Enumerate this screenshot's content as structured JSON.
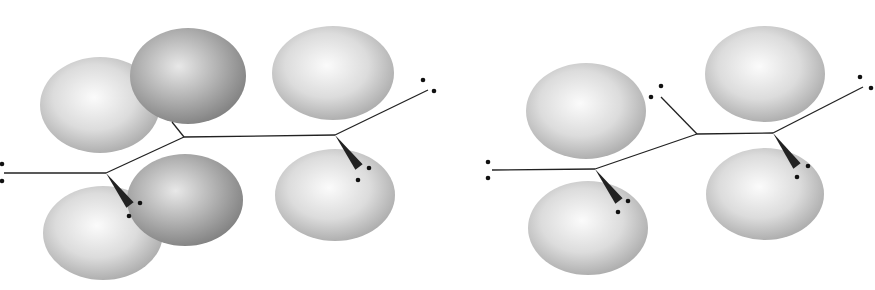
{
  "diagram": {
    "colors": {
      "background": "#ffffff",
      "lobe_light": "#f4f4f4",
      "lobe_mid": "#c9c9c9",
      "lobe_dark": "#8e8e8e",
      "bond": "#222222",
      "dot": "#111111"
    },
    "left_structure": {
      "lobes": [
        {
          "cx": 100,
          "cy": 105,
          "rx": 60,
          "ry": 48,
          "shade": "light"
        },
        {
          "cx": 188,
          "cy": 76,
          "rx": 58,
          "ry": 48,
          "shade": "dark"
        },
        {
          "cx": 333,
          "cy": 73,
          "rx": 61,
          "ry": 47,
          "shade": "light"
        },
        {
          "cx": 103,
          "cy": 233,
          "rx": 60,
          "ry": 47,
          "shade": "light"
        },
        {
          "cx": 185,
          "cy": 200,
          "rx": 58,
          "ry": 46,
          "shade": "dark"
        },
        {
          "cx": 335,
          "cy": 195,
          "rx": 60,
          "ry": 46,
          "shade": "light"
        }
      ],
      "bonds": [
        [
          4,
          173,
          106,
          173
        ],
        [
          106,
          173,
          184,
          137
        ],
        [
          184,
          137,
          172,
          122
        ],
        [
          184,
          137,
          335,
          135
        ],
        [
          335,
          135,
          428,
          90
        ]
      ],
      "wedges": [
        {
          "from": [
            106,
            173
          ],
          "to": [
            130,
            205
          ]
        },
        {
          "from": [
            335,
            135
          ],
          "to": [
            359,
            167
          ]
        }
      ],
      "dots": [
        [
          2,
          164
        ],
        [
          2,
          181
        ],
        [
          140,
          203
        ],
        [
          129,
          216
        ],
        [
          423,
          80
        ],
        [
          434,
          91
        ],
        [
          369,
          168
        ],
        [
          358,
          180
        ]
      ]
    },
    "right_structure": {
      "lobes": [
        {
          "cx": 586,
          "cy": 111,
          "rx": 60,
          "ry": 48,
          "shade": "light"
        },
        {
          "cx": 765,
          "cy": 74,
          "rx": 60,
          "ry": 48,
          "shade": "light"
        },
        {
          "cx": 588,
          "cy": 228,
          "rx": 60,
          "ry": 47,
          "shade": "light"
        },
        {
          "cx": 765,
          "cy": 194,
          "rx": 59,
          "ry": 46,
          "shade": "light"
        }
      ],
      "bonds": [
        [
          492,
          170,
          595,
          169
        ],
        [
          595,
          169,
          697,
          134
        ],
        [
          697,
          134,
          661,
          97
        ],
        [
          697,
          134,
          773,
          133
        ],
        [
          773,
          133,
          863,
          87
        ]
      ],
      "wedges": [
        {
          "from": [
            595,
            169
          ],
          "to": [
            619,
            201
          ]
        },
        {
          "from": [
            773,
            133
          ],
          "to": [
            797,
            166
          ]
        }
      ],
      "dots": [
        [
          488,
          162
        ],
        [
          488,
          178
        ],
        [
          661,
          86
        ],
        [
          651,
          97
        ],
        [
          628,
          201
        ],
        [
          618,
          212
        ],
        [
          860,
          77
        ],
        [
          871,
          88
        ],
        [
          808,
          166
        ],
        [
          797,
          177
        ]
      ]
    }
  }
}
